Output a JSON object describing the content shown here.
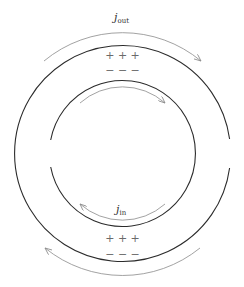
{
  "diagram": {
    "outer_ring": {
      "gap_side": "right"
    },
    "inner_ring": {
      "gap_side": "left"
    },
    "labels": {
      "j_out": {
        "main": "j",
        "sub": "out"
      },
      "j_in": {
        "main": "j",
        "sub": "in"
      }
    },
    "charges": {
      "top_plus": "+ + +",
      "top_minus": "− − −",
      "bottom_plus": "+ + +",
      "bottom_minus": "− − −"
    },
    "arrows": {
      "outer_top": "clockwise",
      "inner_top": "clockwise",
      "inner_bottom": "clockwise",
      "outer_bottom": "clockwise"
    },
    "colors": {
      "ring": "#2b2b2b",
      "arrow": "#8a8a8a",
      "charge": "#6a6a6a"
    }
  }
}
